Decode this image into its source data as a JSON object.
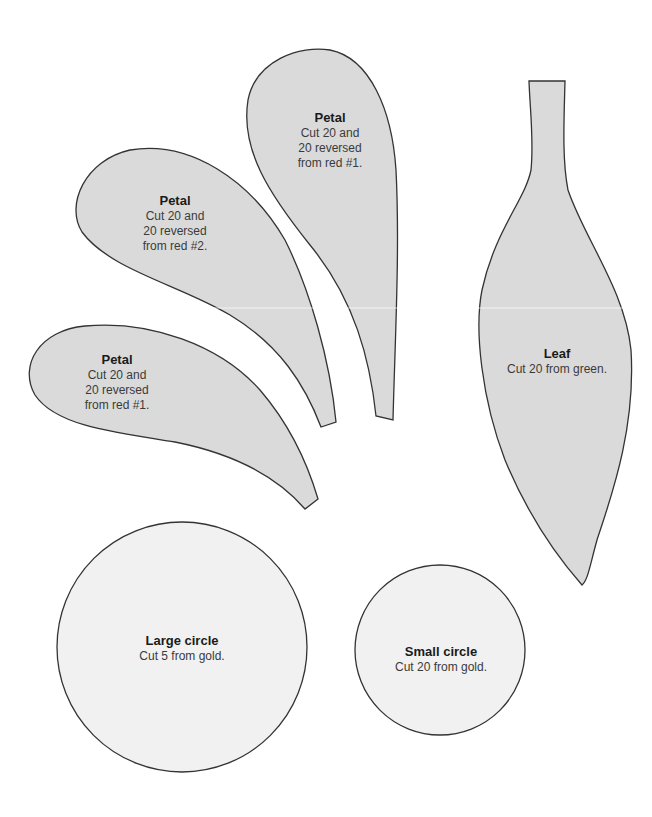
{
  "colors": {
    "petal_fill": "#dadada",
    "leaf_fill": "#dadada",
    "circle_fill": "#f1f1f1",
    "outline": "#333333",
    "background": "#ffffff"
  },
  "shapes": {
    "petal_top": {
      "title": "Petal",
      "lines": [
        "Cut 20 and",
        "20 reversed",
        "from red #1."
      ]
    },
    "petal_middle": {
      "title": "Petal",
      "lines": [
        "Cut 20 and",
        "20 reversed",
        "from red #2."
      ]
    },
    "petal_bottom": {
      "title": "Petal",
      "lines": [
        "Cut 20 and",
        "20 reversed",
        "from red #1."
      ]
    },
    "leaf": {
      "title": "Leaf",
      "lines": [
        "Cut 20 from green."
      ]
    },
    "large_circle": {
      "title": "Large circle",
      "lines": [
        "Cut 5 from gold."
      ]
    },
    "small_circle": {
      "title": "Small circle",
      "lines": [
        "Cut 20 from gold."
      ]
    }
  }
}
